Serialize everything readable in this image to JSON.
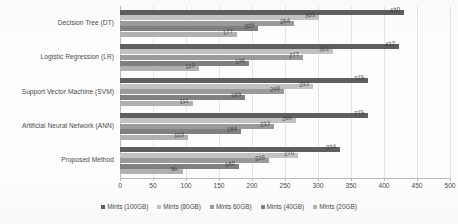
{
  "chart_data": {
    "type": "bar",
    "orientation": "horizontal",
    "title": "",
    "xlabel": "",
    "ylabel": "",
    "xlim": [
      0,
      500
    ],
    "xticks": [
      0,
      50,
      100,
      150,
      200,
      250,
      300,
      350,
      400,
      450,
      500
    ],
    "grid": true,
    "legend_position": "bottom",
    "categories": [
      "Decision Tree (DT)",
      "Logistic Regression (LR)",
      "Support Vector Machine (SVM)",
      "Artificial Neural Network (ANN)",
      "Proposed Method"
    ],
    "series": [
      {
        "name": "Mints (100GB)",
        "color": "#5f5f5f",
        "values": [
          430,
          422,
          375,
          375,
          334
        ],
        "labels": [
          "430",
          "422",
          "375",
          "375",
          "334"
        ]
      },
      {
        "name": "Mints (80GB)",
        "color": "#c2c2c2",
        "values": [
          301,
          322,
          293,
          266,
          270
        ],
        "labels": [
          "301",
          "322",
          "293",
          "266",
          "270"
        ]
      },
      {
        "name": "Mints 60GB)",
        "color": "#9a9a9a",
        "values": [
          264,
          277,
          248,
          233,
          226
        ],
        "labels": [
          "264",
          "277",
          "248",
          "233",
          "226"
        ]
      },
      {
        "name": "Mints (40GB)",
        "color": "#808080",
        "values": [
          209,
          196,
          189,
          184,
          180
        ],
        "labels": [
          "209",
          "196",
          "189",
          "184",
          "180"
        ]
      },
      {
        "name": "Mints (20GB)",
        "color": "#b0b0b0",
        "values": [
          177,
          119,
          111,
          103,
          96
        ],
        "labels": [
          "177",
          "119",
          "111",
          "103",
          "96"
        ]
      }
    ]
  },
  "legend": {
    "items": [
      {
        "label": "Mints (100GB)",
        "color": "#5f5f5f"
      },
      {
        "label": "Mints (80GB)",
        "color": "#c2c2c2"
      },
      {
        "label": "Mints 60GB)",
        "color": "#9a9a9a"
      },
      {
        "label": "Mints (40GB)",
        "color": "#808080"
      },
      {
        "label": "Mints (20GB)",
        "color": "#b0b0b0"
      }
    ]
  }
}
